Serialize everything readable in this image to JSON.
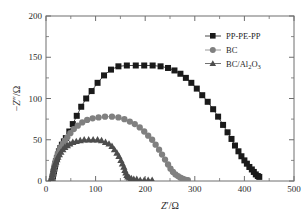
{
  "chart_data": {
    "type": "scatter",
    "title": "",
    "subtitle": "",
    "xlabel": "Z'/Ω",
    "ylabel": "−Z\"/Ω",
    "xlim": [
      0,
      500
    ],
    "ylim": [
      0,
      200
    ],
    "xticks": [
      0,
      100,
      200,
      300,
      400,
      500
    ],
    "yticks": [
      0,
      50,
      100,
      150,
      200
    ],
    "xminor_ticks": [
      50,
      150,
      250,
      350,
      450
    ],
    "yminor_ticks": [
      25,
      75,
      125,
      175
    ],
    "grid": false,
    "legend_position": "top-right",
    "series": [
      {
        "name": "PP-PE-PP",
        "marker": "square",
        "color": "#1a1a1a",
        "points": [
          [
            12,
            1
          ],
          [
            13,
            3
          ],
          [
            14,
            6
          ],
          [
            15,
            9
          ],
          [
            16,
            12
          ],
          [
            17,
            15
          ],
          [
            18,
            18
          ],
          [
            19,
            21
          ],
          [
            20,
            24
          ],
          [
            22,
            28
          ],
          [
            24,
            32
          ],
          [
            26,
            36
          ],
          [
            29,
            40
          ],
          [
            32,
            44
          ],
          [
            36,
            48
          ],
          [
            40,
            52
          ],
          [
            47,
            60
          ],
          [
            54,
            69
          ],
          [
            62,
            79
          ],
          [
            71,
            90
          ],
          [
            81,
            100
          ],
          [
            92,
            109
          ],
          [
            104,
            119
          ],
          [
            117,
            128
          ],
          [
            131,
            135
          ],
          [
            146,
            139
          ],
          [
            163,
            140
          ],
          [
            181,
            140
          ],
          [
            198,
            140
          ],
          [
            215,
            140
          ],
          [
            231,
            139
          ],
          [
            246,
            137
          ],
          [
            259,
            134
          ],
          [
            271,
            130
          ],
          [
            282,
            125
          ],
          [
            293,
            119
          ],
          [
            304,
            112
          ],
          [
            315,
            104
          ],
          [
            326,
            96
          ],
          [
            337,
            87
          ],
          [
            347,
            78
          ],
          [
            357,
            68
          ],
          [
            366,
            59
          ],
          [
            374,
            51
          ],
          [
            381,
            43
          ],
          [
            388,
            36
          ],
          [
            394,
            30
          ],
          [
            400,
            25
          ],
          [
            405,
            21
          ],
          [
            410,
            17
          ],
          [
            415,
            14
          ],
          [
            419,
            11
          ],
          [
            423,
            8
          ],
          [
            427,
            6
          ],
          [
            430,
            5
          ]
        ]
      },
      {
        "name": "BC",
        "marker": "circle",
        "color": "#808080",
        "points": [
          [
            11,
            1
          ],
          [
            12,
            3
          ],
          [
            13,
            6
          ],
          [
            14,
            9
          ],
          [
            15,
            12
          ],
          [
            16,
            15
          ],
          [
            17,
            18
          ],
          [
            18,
            21
          ],
          [
            20,
            25
          ],
          [
            22,
            29
          ],
          [
            24,
            33
          ],
          [
            27,
            37
          ],
          [
            30,
            41
          ],
          [
            34,
            45
          ],
          [
            38,
            49
          ],
          [
            43,
            53
          ],
          [
            49,
            58
          ],
          [
            56,
            63
          ],
          [
            64,
            67
          ],
          [
            73,
            71
          ],
          [
            83,
            74
          ],
          [
            94,
            76
          ],
          [
            106,
            77
          ],
          [
            119,
            78
          ],
          [
            133,
            78
          ],
          [
            146,
            77
          ],
          [
            158,
            75
          ],
          [
            169,
            72
          ],
          [
            179,
            69
          ],
          [
            189,
            65
          ],
          [
            198,
            60
          ],
          [
            206,
            55
          ],
          [
            214,
            50
          ],
          [
            221,
            44
          ],
          [
            228,
            38
          ],
          [
            234,
            32
          ],
          [
            240,
            26
          ],
          [
            246,
            20
          ],
          [
            251,
            15
          ],
          [
            256,
            11
          ],
          [
            261,
            8
          ],
          [
            266,
            6
          ],
          [
            271,
            4
          ],
          [
            275,
            3
          ],
          [
            279,
            2
          ],
          [
            283,
            1
          ],
          [
            286,
            1
          ]
        ]
      },
      {
        "name": "BC/Al2O3",
        "marker": "triangle",
        "color": "#4d4d4d",
        "points": [
          [
            10,
            1
          ],
          [
            11,
            3
          ],
          [
            12,
            5
          ],
          [
            13,
            8
          ],
          [
            14,
            11
          ],
          [
            15,
            14
          ],
          [
            16,
            17
          ],
          [
            18,
            20
          ],
          [
            20,
            23
          ],
          [
            22,
            26
          ],
          [
            24,
            29
          ],
          [
            27,
            32
          ],
          [
            30,
            35
          ],
          [
            34,
            38
          ],
          [
            38,
            41
          ],
          [
            43,
            43
          ],
          [
            48,
            45
          ],
          [
            54,
            47
          ],
          [
            61,
            48
          ],
          [
            69,
            49
          ],
          [
            77,
            50
          ],
          [
            86,
            50
          ],
          [
            95,
            50
          ],
          [
            104,
            50
          ],
          [
            112,
            49
          ],
          [
            120,
            47
          ],
          [
            127,
            45
          ],
          [
            133,
            42
          ],
          [
            138,
            38
          ],
          [
            143,
            34
          ],
          [
            147,
            30
          ],
          [
            151,
            25
          ],
          [
            154,
            21
          ],
          [
            157,
            17
          ],
          [
            159,
            13
          ],
          [
            161,
            10
          ],
          [
            163,
            7
          ],
          [
            165,
            5
          ],
          [
            168,
            4
          ],
          [
            172,
            3
          ],
          [
            177,
            2
          ],
          [
            183,
            2
          ],
          [
            190,
            1
          ],
          [
            198,
            1
          ],
          [
            206,
            1
          ],
          [
            214,
            1
          ]
        ]
      }
    ],
    "legend_entries": [
      "PP-PE-PP",
      "BC",
      "BC/Al2O3"
    ],
    "legend_labels": {
      "entry1": "PP-PE-PP",
      "entry2": "BC",
      "entry3_prefix": "BC/Al",
      "entry3_sub1": "2",
      "entry3_mid": "O",
      "entry3_sub2": "3"
    }
  },
  "axes": {
    "x_label_main": "Z",
    "x_label_prime": "′",
    "x_label_unit": "/Ω",
    "y_label_minus": "−",
    "y_label_main": "Z",
    "y_label_prime": "″",
    "y_label_unit": "/Ω",
    "xtick_labels": [
      "0",
      "100",
      "200",
      "300",
      "400",
      "500"
    ],
    "ytick_labels": [
      "0",
      "50",
      "100",
      "150",
      "200"
    ]
  }
}
